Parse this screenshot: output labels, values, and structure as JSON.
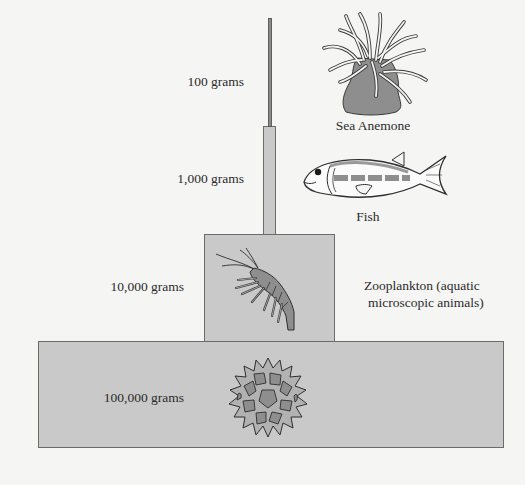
{
  "diagram": {
    "type": "pyramid of biomass",
    "colors": {
      "background": "#f5f5f4",
      "tier_fill": "#c9c9c9",
      "tier_stroke": "#6b6b6b",
      "illustration_fill": "#8e8e8e"
    },
    "tiers": [
      {
        "level": 1,
        "biomass_label": "100 grams",
        "organism_label": "Sea Anemone",
        "icon": "sea-anemone-icon"
      },
      {
        "level": 2,
        "biomass_label": "1,000 grams",
        "organism_label": "Fish",
        "icon": "fish-icon"
      },
      {
        "level": 3,
        "biomass_label": "10,000 grams",
        "organism_label_line1": "Zooplankton (aquatic",
        "organism_label_line2": "microscopic animals)",
        "icon": "shrimp-icon"
      },
      {
        "level": 4,
        "biomass_label": "100,000 grams",
        "icon": "phytoplankton-icon"
      }
    ]
  }
}
